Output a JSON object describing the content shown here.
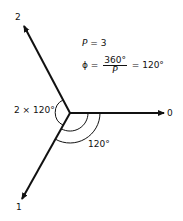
{
  "diagram": {
    "axis_labels": {
      "zero": "0",
      "one": "1",
      "two": "2"
    },
    "equation_p": {
      "var": "P",
      "rest": " = 3"
    },
    "equation_phi": {
      "lhs": "ϕ =",
      "num": "360°",
      "den": "P",
      "rhs": "= 120°"
    },
    "angle_left": "2 × 120°",
    "angle_bottom": "120°"
  }
}
